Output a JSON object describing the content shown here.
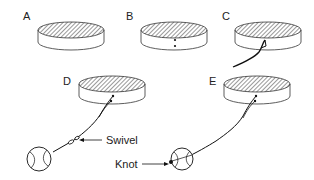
{
  "diagram": {
    "panels": [
      {
        "id": "A",
        "label": "A",
        "description": "plain cylinder"
      },
      {
        "id": "B",
        "label": "B",
        "description": "cylinder with two holes on side"
      },
      {
        "id": "C",
        "label": "C",
        "description": "cord threaded through holes"
      },
      {
        "id": "D",
        "label": "D",
        "description": "cord with swivel attached to ball"
      },
      {
        "id": "E",
        "label": "E",
        "description": "cord tied to ball with knot"
      }
    ],
    "annotations": {
      "swivel": "Swivel",
      "knot": "Knot"
    }
  }
}
